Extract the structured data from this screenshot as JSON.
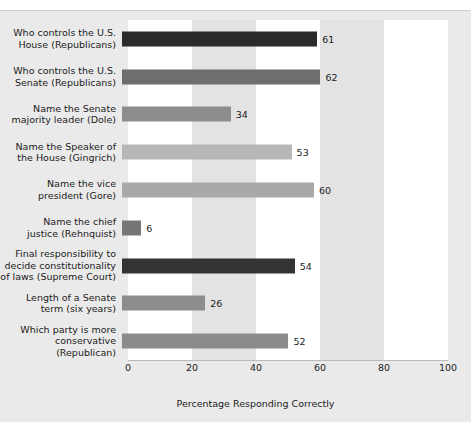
{
  "chart_data": {
    "type": "bar",
    "orientation": "horizontal",
    "title": "",
    "xlabel": "Percentage Responding Correctly",
    "ylabel": "",
    "xlim": [
      0,
      100
    ],
    "xticks": [
      0,
      20,
      40,
      60,
      80,
      100
    ],
    "grid": false,
    "legend": null,
    "categories": [
      "Who controls the U.S.\nHouse (Republicans)",
      "Who controls the U.S.\nSenate (Republicans)",
      "Name the Senate\nmajority leader (Dole)",
      "Name the Speaker of\nthe House (Gingrich)",
      "Name the vice\npresident (Gore)",
      "Name the chief\njustice (Rehnquist)",
      "Final responsibility to\ndecide constitutionality\nof laws (Supreme Court)",
      "Length of a Senate\nterm (six years)",
      "Which party is more\nconservative (Republican)"
    ],
    "values": [
      61,
      62,
      34,
      53,
      60,
      6,
      54,
      26,
      52
    ],
    "value_labels": [
      "61",
      "62",
      "34",
      "53",
      "60",
      "6",
      "54",
      "26",
      "52"
    ],
    "bar_colors": [
      "#2b2b2b",
      "#6e6e6e",
      "#8d8d8d",
      "#b7b7b7",
      "#a9a9a9",
      "#767676",
      "#333333",
      "#8d8d8d",
      "#8b8b8b"
    ]
  },
  "colors": {
    "panel_background": "#eaeaea",
    "band_light": "#ffffff",
    "band_dark": "#e3e3e3",
    "axis": "#b9b9b9",
    "text": "#1b1b1b"
  }
}
